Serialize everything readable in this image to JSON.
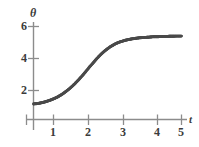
{
  "chart_data": {
    "type": "line",
    "title": "",
    "subtitle": "",
    "xlabel": "t",
    "ylabel": "θ",
    "xlim": [
      0,
      5.25
    ],
    "ylim": [
      0,
      6.6
    ],
    "grid": false,
    "legend": null,
    "marker": "filled-circle",
    "marker_color": "#4a4a4a",
    "line_style": "dotted-thick",
    "axis_color": "#8c8c8c",
    "xticks": [
      1,
      2,
      3,
      4,
      5
    ],
    "xtick_labels": [
      "1",
      "2",
      "3",
      "4",
      "5"
    ],
    "yticks": [
      2,
      4,
      6
    ],
    "ytick_labels": [
      "2",
      "4",
      "6"
    ],
    "series": [
      {
        "name": "θ(t)",
        "x": [
          0.0,
          0.1,
          0.2,
          0.3,
          0.4,
          0.5,
          0.6,
          0.7,
          0.8,
          0.9,
          1.0,
          1.1,
          1.2,
          1.3,
          1.4,
          1.5,
          1.6,
          1.7,
          1.8,
          1.9,
          2.0,
          2.1,
          2.2,
          2.3,
          2.4,
          2.5,
          2.6,
          2.7,
          2.8,
          2.9,
          3.0,
          3.1,
          3.2,
          3.3,
          3.4,
          3.5,
          3.6,
          3.7,
          3.8,
          3.9,
          4.0,
          4.1,
          4.2,
          4.3,
          4.4,
          4.5,
          4.6,
          4.7,
          4.8,
          4.9,
          5.0
        ],
        "y": [
          1.0,
          1.02,
          1.05,
          1.09,
          1.14,
          1.2,
          1.27,
          1.35,
          1.44,
          1.55,
          1.67,
          1.81,
          1.96,
          2.13,
          2.31,
          2.51,
          2.72,
          2.94,
          3.17,
          3.4,
          3.62,
          3.84,
          4.05,
          4.24,
          4.41,
          4.56,
          4.7,
          4.81,
          4.91,
          4.99,
          5.05,
          5.11,
          5.15,
          5.19,
          5.22,
          5.25,
          5.27,
          5.29,
          5.3,
          5.31,
          5.33,
          5.34,
          5.34,
          5.35,
          5.36,
          5.36,
          5.37,
          5.37,
          5.38,
          5.38,
          5.38
        ]
      }
    ],
    "annotations": []
  },
  "axes": {
    "y_axis_name": "θ",
    "x_axis_name": "t",
    "y_tick_labels": [
      "6",
      "4",
      "2"
    ],
    "x_tick_labels": [
      "1",
      "2",
      "3",
      "4",
      "5"
    ]
  },
  "colors": {
    "curve": "#4a4a4a",
    "axis": "#8c8c8c",
    "text": "#3b3b3b",
    "background": "#ffffff"
  }
}
